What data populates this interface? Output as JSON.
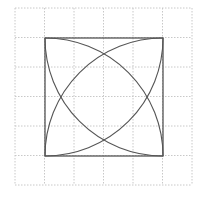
{
  "diagram": {
    "title": "",
    "grid": {
      "x0": 15,
      "y0": 8,
      "cell": 29.5,
      "cols": 6,
      "rows": 6,
      "color": "#c8c8c8",
      "dash": "1.5,1.5"
    },
    "square": {
      "x": 45,
      "y": 38,
      "size": 118,
      "stroke": "#555555",
      "stroke_width": 1.3
    },
    "arcs": [
      {
        "center": "bottom-left",
        "from": "top-left",
        "to": "bottom-right"
      },
      {
        "center": "bottom-right",
        "from": "top-right",
        "to": "bottom-left"
      },
      {
        "center": "top-left",
        "from": "bottom-left",
        "to": "top-right"
      },
      {
        "center": "top-right",
        "from": "top-left",
        "to": "bottom-right"
      }
    ],
    "arc_stroke": "#555555",
    "arc_stroke_width": 1.1
  }
}
